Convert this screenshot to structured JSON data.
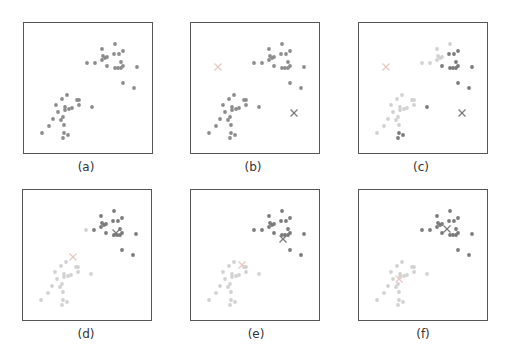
{
  "figure": {
    "colors": {
      "unassigned": "#8c8c8c",
      "cluster_light": "#d2d2d2",
      "cluster_dark": "#7a7a7a",
      "centroid_light": "#e6c9c0",
      "centroid_dark": "#7a7a7a",
      "frame": "#555555"
    },
    "points": [
      [
        78,
        26
      ],
      [
        91,
        21
      ],
      [
        90,
        31
      ],
      [
        95,
        31
      ],
      [
        99,
        28
      ],
      [
        79,
        33
      ],
      [
        81,
        35
      ],
      [
        78,
        37
      ],
      [
        83,
        34
      ],
      [
        63,
        40
      ],
      [
        71,
        40
      ],
      [
        83,
        43
      ],
      [
        91,
        45
      ],
      [
        94,
        45
      ],
      [
        97,
        45
      ],
      [
        99,
        43
      ],
      [
        97,
        39
      ],
      [
        113,
        44
      ],
      [
        99,
        60
      ],
      [
        110,
        65
      ],
      [
        43,
        72
      ],
      [
        38,
        76
      ],
      [
        53,
        77
      ],
      [
        55,
        77
      ],
      [
        32,
        82
      ],
      [
        55,
        82
      ],
      [
        68,
        84
      ],
      [
        41,
        84
      ],
      [
        48,
        85
      ],
      [
        41,
        87
      ],
      [
        45,
        86
      ],
      [
        34,
        89
      ],
      [
        39,
        94
      ],
      [
        29,
        96
      ],
      [
        37,
        97
      ],
      [
        25,
        103
      ],
      [
        40,
        102
      ],
      [
        18,
        110
      ],
      [
        40,
        110
      ],
      [
        39,
        115
      ],
      [
        44,
        112
      ]
    ],
    "panels": [
      {
        "caption": "(a)",
        "assignment": "none",
        "centroids": []
      },
      {
        "caption": "(b)",
        "assignment": "none",
        "centroids": [
          {
            "x": 27,
            "y": 44,
            "color": "light"
          },
          {
            "x": 103,
            "y": 90,
            "color": "dark"
          }
        ]
      },
      {
        "caption": "(c)",
        "assignment": "nearest",
        "centroids": [
          {
            "x": 27,
            "y": 44,
            "color": "light"
          },
          {
            "x": 103,
            "y": 90,
            "color": "dark"
          }
        ]
      },
      {
        "caption": "(d)",
        "assignment": "nearest",
        "centroids": [
          {
            "x": 50,
            "y": 67,
            "color": "light"
          },
          {
            "x": 93,
            "y": 43,
            "color": "dark"
          }
        ]
      },
      {
        "caption": "(e)",
        "assignment": "nearest",
        "centroids": [
          {
            "x": 51,
            "y": 75,
            "color": "light"
          },
          {
            "x": 92,
            "y": 49,
            "color": "dark"
          }
        ]
      },
      {
        "caption": "(f)",
        "assignment": "nearest",
        "centroids": [
          {
            "x": 40,
            "y": 89,
            "color": "light"
          },
          {
            "x": 88,
            "y": 39,
            "color": "dark"
          }
        ]
      }
    ],
    "layout": {
      "panel_positions": [
        {
          "left": 23,
          "top": 22
        },
        {
          "left": 190,
          "top": 22
        },
        {
          "left": 358,
          "top": 22
        },
        {
          "left": 22,
          "top": 189
        },
        {
          "left": 190,
          "top": 189
        },
        {
          "left": 358,
          "top": 189
        }
      ],
      "caption_positions": [
        {
          "x": 86,
          "y": 160
        },
        {
          "x": 253,
          "y": 160
        },
        {
          "x": 421,
          "y": 160
        },
        {
          "x": 86,
          "y": 327
        },
        {
          "x": 256,
          "y": 327
        },
        {
          "x": 423,
          "y": 327
        }
      ]
    }
  }
}
